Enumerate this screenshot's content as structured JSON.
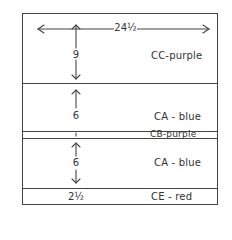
{
  "diagram": {
    "type": "layered stripe dimension sketch",
    "width_label": "24½",
    "sections": [
      {
        "id": "cc",
        "height_label": "9",
        "label": "CC-purple",
        "color": "purple"
      },
      {
        "id": "ca1",
        "height_label": "6",
        "label": "CA - blue",
        "color": "blue"
      },
      {
        "id": "cb",
        "height_label": "1",
        "label": "CB-purple",
        "color": "purple"
      },
      {
        "id": "ca2",
        "height_label": "6",
        "label": "CA - blue",
        "color": "blue"
      },
      {
        "id": "ce",
        "height_label": "2½",
        "label": "CE - red",
        "color": "red"
      }
    ]
  }
}
